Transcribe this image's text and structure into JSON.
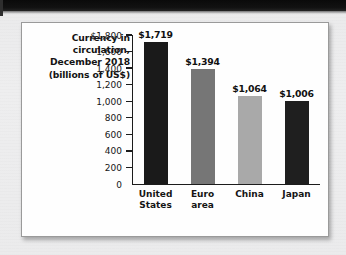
{
  "figure": {
    "title_lines": [
      "Currency in",
      "circulation,",
      "December 2018",
      "(billions of US$)"
    ]
  },
  "chart_data": {
    "type": "bar",
    "xlabel": "",
    "ylabel": "",
    "ylim": [
      0,
      1800
    ],
    "grid": false,
    "legend": "none",
    "categories": [
      "United States",
      "Euro area",
      "China",
      "Japan"
    ],
    "category_lines": [
      [
        "United",
        "States"
      ],
      [
        "Euro",
        "area"
      ],
      [
        "China"
      ],
      [
        "Japan"
      ]
    ],
    "values": [
      1719,
      1394,
      1064,
      1006
    ],
    "value_labels": [
      "$1,719",
      "$1,394",
      "$1,064",
      "$1,006"
    ],
    "bar_colors": [
      "#1a1a1a",
      "#767676",
      "#a9a9a9",
      "#1f1f1f"
    ],
    "ytick_values": [
      1800,
      1600,
      1400,
      1200,
      1000,
      800,
      600,
      400,
      200,
      0
    ],
    "ytick_labels": [
      "$1,800",
      "1,600",
      "1,400",
      "1,200",
      "1,000",
      "800",
      "600",
      "400",
      "200",
      "0"
    ]
  }
}
